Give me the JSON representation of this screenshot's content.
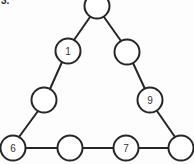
{
  "figure": {
    "label": "3.",
    "caption": "",
    "background_color": "#fdfdfd",
    "line_color": "#262626",
    "node_fill_color": "#ffffff",
    "label_color": "#333333"
  },
  "diagram": {
    "type": "magic-triangle-puzzle",
    "shape": "triangle",
    "node_radius": 12.5,
    "nodes": [
      {
        "id": "apex",
        "label": "",
        "cx": 97,
        "cy": 6,
        "clipped": "top"
      },
      {
        "id": "left-upper",
        "label": "1",
        "cx": 68,
        "cy": 51,
        "clipped": ""
      },
      {
        "id": "right-upper",
        "label": "",
        "cx": 127,
        "cy": 52,
        "clipped": ""
      },
      {
        "id": "left-middle",
        "label": "",
        "cx": 44,
        "cy": 100,
        "clipped": ""
      },
      {
        "id": "right-middle",
        "label": "9",
        "cx": 150,
        "cy": 100,
        "clipped": ""
      },
      {
        "id": "bottom-left",
        "label": "6",
        "cx": 13,
        "cy": 148,
        "clipped": ""
      },
      {
        "id": "bottom-mid-left",
        "label": "",
        "cx": 70,
        "cy": 148,
        "clipped": ""
      },
      {
        "id": "bottom-mid-right",
        "label": "7",
        "cx": 126,
        "cy": 148,
        "clipped": ""
      },
      {
        "id": "bottom-right",
        "label": "",
        "cx": 181,
        "cy": 148,
        "clipped": "right"
      }
    ],
    "edges": [
      {
        "from": "apex",
        "to": "left-upper"
      },
      {
        "from": "left-upper",
        "to": "left-middle"
      },
      {
        "from": "left-middle",
        "to": "bottom-left"
      },
      {
        "from": "apex",
        "to": "right-upper"
      },
      {
        "from": "right-upper",
        "to": "right-middle"
      },
      {
        "from": "right-middle",
        "to": "bottom-right"
      },
      {
        "from": "bottom-left",
        "to": "bottom-mid-left"
      },
      {
        "from": "bottom-mid-left",
        "to": "bottom-mid-right"
      },
      {
        "from": "bottom-mid-right",
        "to": "bottom-right"
      }
    ]
  }
}
